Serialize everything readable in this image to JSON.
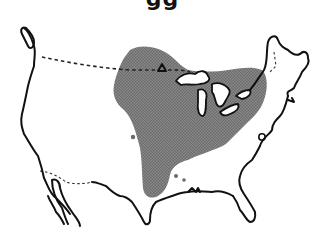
{
  "caption_fragment": "gg",
  "map": {
    "type": "species range map",
    "region": "United States and southern Canada",
    "range_color": "#7a7a7a",
    "outline_color": "#111111",
    "background": "#ffffff",
    "features": [
      "shaded range covering Great Lakes region and central/eastern US",
      "dashed US–Canada border",
      "dashed US–Mexico border",
      "outlying range dots in Texas/Oklahoma area"
    ]
  }
}
